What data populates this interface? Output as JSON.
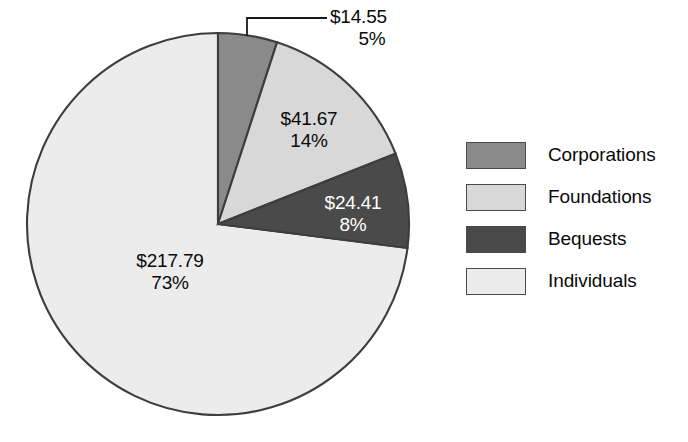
{
  "chart_data": {
    "type": "pie",
    "title": "",
    "subtitle": "",
    "categories": [
      "Corporations",
      "Foundations",
      "Bequests",
      "Individuals"
    ],
    "values": [
      14.55,
      41.67,
      24.41,
      217.79
    ],
    "percentages": [
      5,
      14,
      8,
      73
    ],
    "value_labels": [
      "$14.55",
      "$41.67",
      "$24.41",
      "$217.79"
    ],
    "percent_labels": [
      "5%",
      "14%",
      "8%",
      "73%"
    ],
    "colors": [
      "#8a8a8a",
      "#d8d8d8",
      "#4a4a4a",
      "#ececec"
    ],
    "label_text_colors": [
      "#0a0a0a",
      "#0a0a0a",
      "#ffffff",
      "#0a0a0a"
    ],
    "start_angle_deg": 0,
    "direction": "clockwise",
    "total": 298.42,
    "legend_position": "right",
    "grid": false,
    "xlabel": "",
    "ylabel": "",
    "has_leader_line": true,
    "leader_line_for": "Corporations"
  },
  "slices": [
    {
      "name": "Corporations",
      "value_label": "$14.55",
      "percent_label": "5%",
      "color": "#8a8a8a"
    },
    {
      "name": "Foundations",
      "value_label": "$41.67",
      "percent_label": "14%",
      "color": "#d8d8d8"
    },
    {
      "name": "Bequests",
      "value_label": "$24.41",
      "percent_label": "8%",
      "color": "#4a4a4a"
    },
    {
      "name": "Individuals",
      "value_label": "$217.79",
      "percent_label": "73%",
      "color": "#ececec"
    }
  ],
  "legend": {
    "items": [
      {
        "label": "Corporations",
        "color": "#8a8a8a"
      },
      {
        "label": "Foundations",
        "color": "#d8d8d8"
      },
      {
        "label": "Bequests",
        "color": "#4a4a4a"
      },
      {
        "label": "Individuals",
        "color": "#ececec"
      }
    ]
  }
}
